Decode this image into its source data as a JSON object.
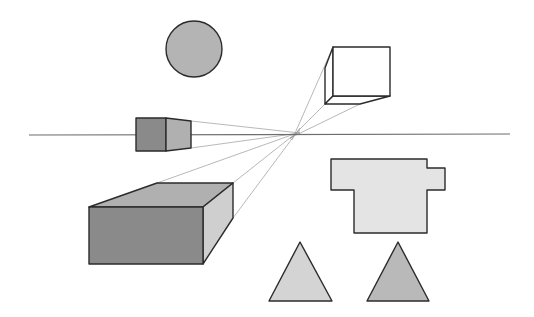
{
  "diagram": {
    "title": "",
    "type": "one-point-perspective",
    "colors": {
      "background": "#ffffff",
      "outline": "#2b2b2b",
      "guide": "#9a9a9a",
      "horizon": "#6e6e6e",
      "circle_fill": "#b4b4b4",
      "dark_face": "#8a8a8a",
      "mid_face": "#b0b0b0",
      "light_face": "#cfcfcf",
      "pale_fill": "#e4e4e4",
      "cube_fill": "#ffffff",
      "triangle_light": "#d4d4d4",
      "triangle_dark": "#b9b9b9"
    },
    "horizon_line": {
      "x1": 29,
      "y1": 135,
      "x2": 510,
      "y2": 134
    },
    "vanishing_point": {
      "x": 296,
      "y": 134
    },
    "circle": {
      "cx": 194,
      "cy": 49,
      "r": 28
    },
    "small_box": {
      "front": "136,118 166,118 166,151 136,151",
      "side": "166,118 191,121 191,148 166,151"
    },
    "floating_cube": {
      "front": "333,47 390,47 390,96 333,96",
      "left": "325,68 333,47 333,96 325,104",
      "bottom": "325,104 333,96 390,96 360,104"
    },
    "large_box": {
      "front": "89,207 203,207 203,264 89,264",
      "top": "89,207 157,183 233,183 203,207",
      "side": "203,207 233,183 233,218 203,264"
    },
    "cross_shape": {
      "points": "331,159 427,159 427,168 445,168 445,190 427,190 427,233 354,233 354,190 331,190"
    },
    "triangles": [
      {
        "points": "300,242 332,301 269,301"
      },
      {
        "points": "398,242 429,301 367,301"
      }
    ],
    "guide_lines": [
      {
        "x1": 191,
        "y1": 121,
        "x2": 300,
        "y2": 133
      },
      {
        "x1": 191,
        "y1": 148,
        "x2": 300,
        "y2": 133
      },
      {
        "x1": 157,
        "y1": 183,
        "x2": 300,
        "y2": 132
      },
      {
        "x1": 233,
        "y1": 183,
        "x2": 300,
        "y2": 130
      },
      {
        "x1": 233,
        "y1": 218,
        "x2": 300,
        "y2": 128
      },
      {
        "x1": 333,
        "y1": 47,
        "x2": 292,
        "y2": 140
      },
      {
        "x1": 325,
        "y1": 104,
        "x2": 290,
        "y2": 139
      },
      {
        "x1": 360,
        "y1": 104,
        "x2": 290,
        "y2": 138
      }
    ]
  }
}
